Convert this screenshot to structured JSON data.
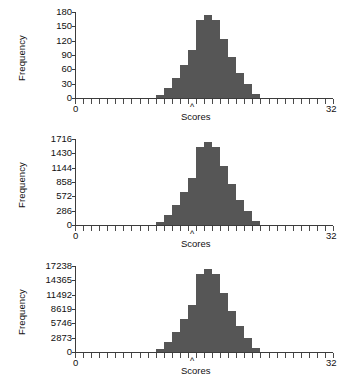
{
  "figure": {
    "background": "#ffffff",
    "bar_color": "#565656",
    "axis_color": "#3c3c3c"
  },
  "charts": [
    {
      "id": "histogram-top",
      "ylabel": "Frequency",
      "xlabel": "Scores",
      "center_marker": "^",
      "x_min_label": "0",
      "x_max_label": "32",
      "yticks": [
        "0",
        "30",
        "60",
        "90",
        "120",
        "150",
        "180"
      ]
    },
    {
      "id": "histogram-middle",
      "ylabel": "Frequency",
      "xlabel": "Scores",
      "center_marker": "^",
      "x_min_label": "0",
      "x_max_label": "32",
      "yticks": [
        "0",
        "286",
        "572",
        "858",
        "1144",
        "1430",
        "1716"
      ]
    },
    {
      "id": "histogram-bottom",
      "ylabel": "Frequency",
      "xlabel": "Scores",
      "center_marker": "^",
      "x_min_label": "0",
      "x_max_label": "32",
      "yticks": [
        "0",
        "2873",
        "5746",
        "8619",
        "11492",
        "14365",
        "17238"
      ]
    }
  ],
  "chart_data": [
    {
      "type": "bar",
      "title": "",
      "xlabel": "Scores",
      "ylabel": "Frequency",
      "xlim": [
        0,
        32
      ],
      "ylim": [
        0,
        190
      ],
      "grid": false,
      "legend": null,
      "annotations": [
        {
          "text": "^",
          "x": 16,
          "y": 0,
          "note": "population mean marker below axis"
        }
      ],
      "tick_labels_y": [
        "0",
        "30",
        "60",
        "90",
        "120",
        "150",
        "180"
      ],
      "tick_labels_x": [
        "0",
        "32"
      ],
      "x_tick_count": 33,
      "bin_width": 1,
      "categories": [
        10,
        11,
        12,
        13,
        14,
        15,
        16,
        17,
        18,
        19,
        20,
        21,
        22
      ],
      "values": [
        7,
        22,
        45,
        72,
        105,
        172,
        183,
        172,
        131,
        90,
        56,
        30,
        9
      ]
    },
    {
      "type": "bar",
      "title": "",
      "xlabel": "Scores",
      "ylabel": "Frequency",
      "xlim": [
        0,
        32
      ],
      "ylim": [
        0,
        1810
      ],
      "grid": false,
      "legend": null,
      "annotations": [
        {
          "text": "^",
          "x": 16,
          "y": 0,
          "note": "population mean marker below axis"
        }
      ],
      "tick_labels_y": [
        "0",
        "286",
        "572",
        "858",
        "1144",
        "1430",
        "1716"
      ],
      "tick_labels_x": [
        "0",
        "32"
      ],
      "x_tick_count": 33,
      "bin_width": 1,
      "categories": [
        10,
        11,
        12,
        13,
        14,
        15,
        16,
        17,
        18,
        19,
        20,
        21,
        22
      ],
      "values": [
        70,
        215,
        430,
        690,
        1000,
        1640,
        1745,
        1640,
        1250,
        860,
        535,
        290,
        90
      ]
    },
    {
      "type": "bar",
      "title": "",
      "xlabel": "Scores",
      "ylabel": "Frequency",
      "xlim": [
        0,
        32
      ],
      "ylim": [
        0,
        18200
      ],
      "grid": false,
      "legend": null,
      "annotations": [
        {
          "text": "^",
          "x": 16,
          "y": 0,
          "note": "population mean marker below axis"
        }
      ],
      "tick_labels_y": [
        "0",
        "2873",
        "5746",
        "8619",
        "11492",
        "14365",
        "17238"
      ],
      "tick_labels_x": [
        "0",
        "32"
      ],
      "x_tick_count": 33,
      "bin_width": 1,
      "categories": [
        10,
        11,
        12,
        13,
        14,
        15,
        16,
        17,
        18,
        19,
        20,
        21,
        22
      ],
      "values": [
        700,
        2150,
        4300,
        6900,
        10050,
        16500,
        17550,
        16500,
        12550,
        8650,
        5400,
        2900,
        900
      ]
    }
  ]
}
